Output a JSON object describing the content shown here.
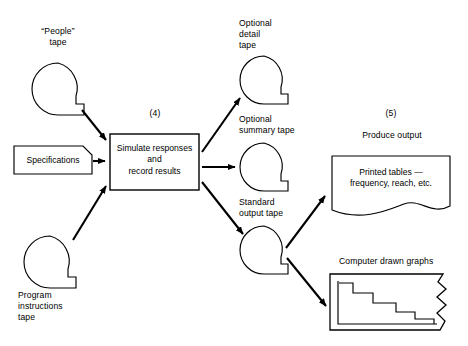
{
  "diagram": {
    "title_absent": true,
    "background_color": "#ffffff",
    "stroke_color": "#000000",
    "nodes": {
      "people_tape": {
        "label": "“People”\ntape",
        "shape": "magnetic-tape",
        "cx": 58,
        "cy": 89,
        "r": 26
      },
      "specifications": {
        "label": "Specifications",
        "shape": "input-document",
        "x": 14,
        "y": 146,
        "w": 78,
        "h": 28
      },
      "program_instructions_tape": {
        "label": "Program\ninstructions\ntape",
        "shape": "magnetic-tape",
        "cx": 50,
        "cy": 262,
        "r": 26
      },
      "process_simulate": {
        "step_number": "(4)",
        "label": "Simulate responses\nand\nrecord results",
        "shape": "process-box",
        "x": 110,
        "y": 134,
        "w": 89,
        "h": 56
      },
      "optional_detail_tape": {
        "label": "Optional\ndetail\ntape",
        "shape": "magnetic-tape",
        "cx": 264,
        "cy": 80,
        "r": 24
      },
      "optional_summary_tape": {
        "label": "Optional\nsummary tape",
        "shape": "magnetic-tape",
        "cx": 264,
        "cy": 167,
        "r": 24
      },
      "standard_output_tape": {
        "label": "Standard\noutput tape",
        "shape": "magnetic-tape",
        "cx": 264,
        "cy": 250,
        "r": 24
      },
      "produce_output": {
        "step_number": "(5)",
        "label": "Produce output"
      },
      "printed_tables": {
        "label": "Printed tables —\nfrequency, reach, etc.",
        "shape": "document-wavy-bottom",
        "x": 332,
        "y": 156,
        "w": 118,
        "h": 60
      },
      "computer_drawn_graphs": {
        "label": "Computer drawn graphs",
        "shape": "torn-edge-box-with-step-chart",
        "x": 330,
        "y": 274,
        "w": 120,
        "h": 56
      }
    },
    "edges": [
      {
        "from": "people_tape",
        "to": "process_simulate",
        "arrow": "single"
      },
      {
        "from": "specifications",
        "to": "process_simulate",
        "arrow": "single"
      },
      {
        "from": "program_instructions_tape",
        "to": "process_simulate",
        "arrow": "single"
      },
      {
        "from": "process_simulate",
        "to": "optional_detail_tape",
        "arrow": "single"
      },
      {
        "from": "process_simulate",
        "to": "optional_summary_tape",
        "arrow": "single"
      },
      {
        "from": "process_simulate",
        "to": "standard_output_tape",
        "arrow": "single"
      },
      {
        "from": "standard_output_tape",
        "to": "printed_tables",
        "arrow": "single"
      },
      {
        "from": "standard_output_tape",
        "to": "computer_drawn_graphs",
        "arrow": "single"
      }
    ],
    "step_chart": {
      "type": "step",
      "description": "descending staircase inside computer drawn graphs box",
      "levels": [
        5,
        4,
        3,
        2,
        1
      ]
    }
  }
}
